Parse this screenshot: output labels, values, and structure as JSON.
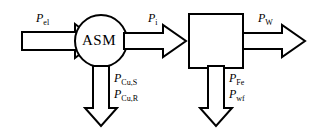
{
  "diagram": {
    "nodes": [
      {
        "id": "asm",
        "label": "ASM",
        "shape": "circle"
      },
      {
        "id": "mech",
        "label": "",
        "shape": "square"
      }
    ],
    "flows": [
      {
        "id": "p-el",
        "symbol": "P",
        "subscript": "el",
        "direction": "right",
        "role": "input"
      },
      {
        "id": "p-i",
        "symbol": "P",
        "subscript": "i",
        "direction": "right",
        "role": "internal"
      },
      {
        "id": "p-w",
        "symbol": "P",
        "subscript": "W",
        "direction": "right",
        "role": "output"
      }
    ],
    "losses": [
      {
        "id": "loss-copper",
        "direction": "down",
        "labels": [
          {
            "symbol": "P",
            "subscript": "Cu,S"
          },
          {
            "symbol": "P",
            "subscript": "Cu,R"
          }
        ]
      },
      {
        "id": "loss-iron-friction",
        "direction": "down",
        "labels": [
          {
            "symbol": "P",
            "subscript": "Fe"
          },
          {
            "symbol": "P",
            "subscript": "wf"
          }
        ]
      }
    ],
    "colors": {
      "stroke": "#000000",
      "fill": "#ffffff",
      "background": "#ffffff"
    }
  }
}
